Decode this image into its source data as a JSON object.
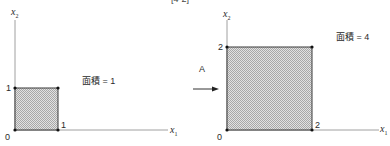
{
  "figure_label": "[4-2]",
  "left_panel": {
    "y_axis_label_var": "x",
    "y_axis_label_sub": "2",
    "x_axis_label_var": "x",
    "x_axis_label_sub": "1",
    "origin_label": "0",
    "y_tick_label": "1",
    "x_tick_label": "1",
    "area_text": "面積 = 1",
    "square": {
      "x_min": 0,
      "x_max": 1,
      "y_min": 0,
      "y_max": 1
    }
  },
  "transform": {
    "label": "A",
    "arrow": "right-arrow"
  },
  "right_panel": {
    "y_axis_label_var": "x",
    "y_axis_label_sub": "2",
    "x_axis_label_var": "x",
    "x_axis_label_sub": "1",
    "origin_label": "0",
    "y_tick_label": "2",
    "x_tick_label": "2",
    "area_text": "面積 = 4",
    "square": {
      "x_min": 0,
      "x_max": 2,
      "y_min": 0,
      "y_max": 2
    }
  },
  "colors": {
    "axis": "#9a9a9a",
    "square_edge": "#3a3a3a",
    "hatch_fill": "#bdbdbd",
    "vertex": "#111111"
  }
}
